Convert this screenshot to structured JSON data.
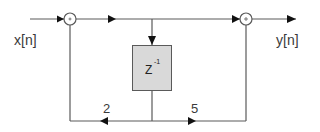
{
  "diagram": {
    "type": "block-diagram",
    "input_label": "x[n]",
    "output_label": "y[n]",
    "delay_block": {
      "label": "Z",
      "exponent": "-1"
    },
    "summers": [
      {
        "id": "sum1",
        "symbol": "+"
      },
      {
        "id": "sum2",
        "symbol": "+"
      }
    ],
    "gains": [
      {
        "id": "gain-left",
        "value": "2",
        "direction": "left"
      },
      {
        "id": "gain-right",
        "value": "5",
        "direction": "right"
      }
    ],
    "colors": {
      "line": "#5a5a5a",
      "block_fill": "#d9d9d9",
      "arrow": "#111111"
    }
  }
}
